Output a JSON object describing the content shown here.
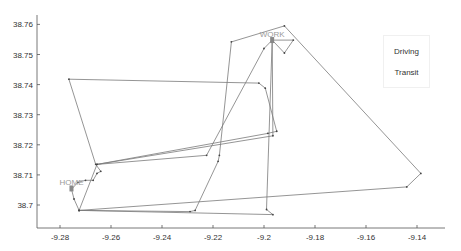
{
  "chart_data": {
    "type": "line",
    "title": "",
    "xlabel": "",
    "ylabel": "",
    "xlim": [
      -9.289,
      -9.129
    ],
    "ylim": [
      38.6925,
      38.7615
    ],
    "x_ticks": [
      -9.28,
      -9.26,
      -9.24,
      -9.22,
      -9.2,
      -9.18,
      -9.16,
      -9.14
    ],
    "x_tick_labels": [
      "-9.28",
      "-9.26",
      "-9.24",
      "-9.22",
      "-9.2",
      "-9.18",
      "-9.16",
      "-9.14"
    ],
    "y_ticks": [
      38.7,
      38.71,
      38.72,
      38.73,
      38.74,
      38.75,
      38.76
    ],
    "y_tick_labels": [
      "38.7",
      "38.71",
      "38.72",
      "38.73",
      "38.74",
      "38.75",
      "38.76"
    ],
    "grid": false,
    "legend": {
      "position": "upper right",
      "entries": [
        "Driving",
        "Transit"
      ]
    },
    "annotations": [
      {
        "text": "HOME",
        "lon": -9.2755,
        "lat": 38.7055
      },
      {
        "text": "WORK",
        "lon": -9.1968,
        "lat": 38.7548
      }
    ],
    "series": [
      {
        "name": "Driving",
        "color": "#7a7a7a",
        "points": [
          [
            -9.2755,
            38.7052
          ],
          [
            -9.2745,
            38.702
          ],
          [
            -9.2725,
            38.6982
          ],
          [
            -9.229,
            38.6978
          ],
          [
            -9.227,
            38.6982
          ],
          [
            -9.218,
            38.7145
          ],
          [
            -9.2175,
            38.7165
          ],
          [
            -9.2128,
            38.7542
          ],
          [
            -9.192,
            38.7595
          ],
          [
            -9.1385,
            38.7105
          ],
          [
            -9.144,
            38.706
          ],
          [
            -9.2725,
            38.6982
          ]
        ]
      },
      {
        "name": "Transit",
        "color": "#7a7a7a",
        "points": [
          [
            -9.2755,
            38.7052
          ],
          [
            -9.273,
            38.7075
          ],
          [
            -9.27,
            38.7082
          ],
          [
            -9.267,
            38.7082
          ],
          [
            -9.2655,
            38.7105
          ],
          [
            -9.264,
            38.7112
          ],
          [
            -9.266,
            38.7135
          ],
          [
            -9.2765,
            38.7418
          ],
          [
            -9.202,
            38.7405
          ],
          [
            -9.1995,
            38.7388
          ],
          [
            -9.195,
            38.7245
          ],
          [
            -9.1985,
            38.7238
          ],
          [
            -9.2655,
            38.7135
          ],
          [
            -9.2225,
            38.7165
          ],
          [
            -9.2,
            38.752
          ],
          [
            -9.1968,
            38.7548
          ],
          [
            -9.199,
            38.6985
          ],
          [
            -9.1965,
            38.6968
          ],
          [
            -9.2725,
            38.6982
          ],
          [
            -9.2655,
            38.7135
          ],
          [
            -9.1965,
            38.723
          ],
          [
            -9.1968,
            38.7548
          ],
          [
            -9.1885,
            38.7548
          ],
          [
            -9.192,
            38.7505
          ],
          [
            -9.1968,
            38.7548
          ]
        ]
      }
    ]
  },
  "legend": {
    "items": [
      {
        "label": "Driving"
      },
      {
        "label": "Transit"
      }
    ]
  },
  "labels": {
    "home": "HOME",
    "work": "WORK"
  }
}
